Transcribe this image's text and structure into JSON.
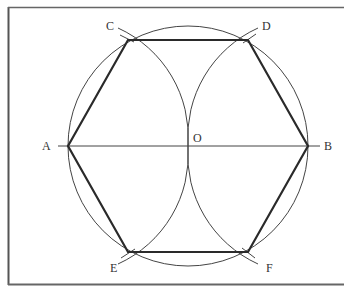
{
  "diagram": {
    "colors": {
      "background": "#ffffff",
      "frame": "#555555",
      "thin_line": "#444444",
      "thick_line": "#2a2a2a",
      "label": "#333333"
    },
    "center": {
      "name": "O",
      "x": 188,
      "y": 146
    },
    "radius": 120,
    "points": {
      "A": {
        "label": "A",
        "x": 68,
        "y": 146
      },
      "B": {
        "label": "B",
        "x": 308,
        "y": 146
      },
      "C": {
        "label": "C",
        "x": 128,
        "y": 40
      },
      "D": {
        "label": "D",
        "x": 248,
        "y": 40
      },
      "E": {
        "label": "E",
        "x": 128,
        "y": 252
      },
      "F": {
        "label": "F",
        "x": 248,
        "y": 252
      },
      "O": {
        "label": "O",
        "x": 188,
        "y": 146
      }
    },
    "labels": {
      "A": "A",
      "B": "B",
      "C": "C",
      "D": "D",
      "E": "E",
      "F": "F",
      "O": "O"
    },
    "hexagon_order": [
      "A",
      "C",
      "D",
      "B",
      "F",
      "E"
    ],
    "construction_arcs": [
      {
        "center": "A",
        "radius": 120,
        "through": [
          "C",
          "O",
          "E"
        ]
      },
      {
        "center": "B",
        "radius": 120,
        "through": [
          "D",
          "O",
          "F"
        ]
      }
    ],
    "diameter": {
      "from": "A",
      "to": "B"
    }
  }
}
